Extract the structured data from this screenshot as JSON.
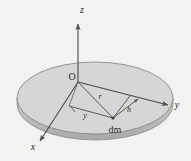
{
  "figure": {
    "background_color": "#f2f2f0",
    "disk": {
      "fill_color": "#d6d6d6",
      "edge_color": "#8c8c8c",
      "rim_color": "#bdbdbd",
      "shape": "ellipse",
      "center_x": 95,
      "center_y": 98,
      "radius_x": 78,
      "radius_y": 36,
      "thickness": 9
    },
    "origin": {
      "label": "O",
      "x": 78,
      "y": 82
    },
    "mass_element": {
      "label": "dm",
      "point_x": 113,
      "point_y": 118
    },
    "axes": [
      {
        "name": "z-axis",
        "label": "z",
        "label_x": 82,
        "label_y": 13,
        "direction": "up"
      },
      {
        "name": "y-axis",
        "label": "y",
        "label_x": 177,
        "label_y": 108,
        "direction": "right"
      },
      {
        "name": "x-axis",
        "label": "x",
        "label_x": 33,
        "label_y": 150,
        "direction": "down-left"
      }
    ],
    "measures": [
      {
        "name": "radius-vector",
        "label": "r",
        "label_x": 100,
        "label_y": 99,
        "description": "distance from origin O to mass element dm"
      },
      {
        "name": "perpendicular-distance",
        "label": "h",
        "label_x": 127,
        "label_y": 110,
        "description": "perpendicular distance from dm to the y axis"
      },
      {
        "name": "y-coordinate",
        "label": "y",
        "label_x": 85,
        "label_y": 117,
        "description": "y coordinate of mass element dm"
      }
    ],
    "stroke": {
      "line_color": "#4a4a4a",
      "line_width": 1
    }
  }
}
